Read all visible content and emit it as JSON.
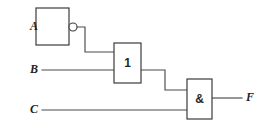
{
  "diagram": {
    "type": "logic-circuit",
    "notation": "IEC rectangular symbols",
    "background_color": "#ffffff",
    "wire_color": "#4a4a4a",
    "outline_color": "#3b3b3b",
    "text_color": "#1f1f1f"
  },
  "inputs": [
    {
      "id": "A",
      "label": "A",
      "x": 30,
      "y": 27
    },
    {
      "id": "B",
      "label": "B",
      "x": 30,
      "y": 70
    },
    {
      "id": "C",
      "label": "C",
      "x": 30,
      "y": 110
    }
  ],
  "outputs": [
    {
      "id": "F",
      "label": "F",
      "x": 246,
      "y": 98
    }
  ],
  "gates": [
    {
      "id": "inverter",
      "label": "",
      "function": "NOT",
      "inverted_output": true,
      "box": {
        "x": 36,
        "y": 8,
        "w": 33,
        "h": 37
      }
    },
    {
      "id": "or-gate",
      "label": "1",
      "function": "OR",
      "inverted_output": false,
      "box": {
        "x": 114,
        "y": 43,
        "w": 27,
        "h": 40
      }
    },
    {
      "id": "and-gate",
      "label": "&",
      "function": "AND",
      "inverted_output": false,
      "box": {
        "x": 187,
        "y": 79,
        "w": 25,
        "h": 40
      }
    }
  ],
  "bubbles": [
    {
      "id": "inverter-bubble",
      "cx": 73,
      "cy": 27,
      "r": 4
    }
  ],
  "wires": [
    {
      "id": "wire-a-in",
      "from": "A",
      "to": "inverter",
      "points": "42,27 36,27"
    },
    {
      "id": "wire-not-to-or",
      "from": "inverter",
      "to": "or-gate",
      "points": "77,27 85,27 85,52 114,52"
    },
    {
      "id": "wire-b-in",
      "from": "B",
      "to": "or-gate",
      "points": "42,70 114,70"
    },
    {
      "id": "wire-or-to-and",
      "from": "or-gate",
      "to": "and-gate",
      "points": "141,70 165,70 165,90 187,90"
    },
    {
      "id": "wire-c-in",
      "from": "C",
      "to": "and-gate",
      "points": "42,110 187,110"
    },
    {
      "id": "wire-f-out",
      "from": "and-gate",
      "to": "F",
      "points": "212,98 242,98"
    }
  ]
}
